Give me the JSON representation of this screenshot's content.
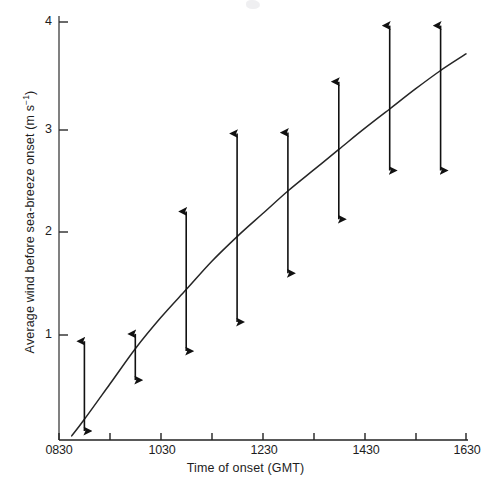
{
  "figure": {
    "background_color": "#ffffff",
    "ink_color": "#1a1a1a"
  },
  "axis": {
    "y_title": "Average wind before sea-breeze onset (m s",
    "y_title_exponent": "−1",
    "y_title_close": ")",
    "x_title": "Time of onset (GMT)",
    "y_tick_labels": [
      "4",
      "3",
      "2",
      "1"
    ],
    "x_tick_labels": [
      "0830",
      "1030",
      "1230",
      "1430",
      "1630"
    ]
  },
  "chart_data": {
    "type": "line",
    "title": "",
    "subtitle": "",
    "xlabel": "Time of onset (GMT)",
    "ylabel": "Average wind before sea-breeze onset (m s^-1)",
    "grid": false,
    "legend": null,
    "xlim_labels": [
      "0830",
      "1630"
    ],
    "xlim_minutes": [
      510,
      990
    ],
    "ylim": [
      0,
      4.15
    ],
    "y_ticks": [
      1,
      2,
      3,
      4
    ],
    "x_ticks_labeled": [
      "0830",
      "1030",
      "1230",
      "1430",
      "1630"
    ],
    "x_ticks_minor_unlabeled": [
      "0930",
      "1130",
      "1330",
      "1530"
    ],
    "fitted_curve": {
      "name": "Fitted trend of average wind before sea-breeze onset",
      "x": [
        "0845",
        "0900",
        "0930",
        "1000",
        "1030",
        "1100",
        "1130",
        "1200",
        "1230",
        "1300",
        "1330",
        "1400",
        "1430",
        "1500",
        "1530",
        "1600",
        "1630"
      ],
      "y": [
        0.02,
        0.18,
        0.52,
        0.86,
        1.16,
        1.43,
        1.7,
        1.94,
        2.16,
        2.38,
        2.58,
        2.78,
        2.98,
        3.17,
        3.36,
        3.54,
        3.7
      ]
    },
    "range_bars": {
      "name": "Range of wind speed (double-headed arrows)",
      "marker": "double-headed-arrow",
      "points": [
        {
          "x": "0900",
          "y_top": 1.0,
          "y_bottom": 0.0
        },
        {
          "x": "1000",
          "y_top": 1.07,
          "y_bottom": 0.49
        },
        {
          "x": "1100",
          "y_top": 2.25,
          "y_bottom": 0.77
        },
        {
          "x": "1200",
          "y_top": 3.0,
          "y_bottom": 1.05
        },
        {
          "x": "1300",
          "y_top": 3.01,
          "y_bottom": 1.52
        },
        {
          "x": "1400",
          "y_top": 3.5,
          "y_bottom": 2.04
        },
        {
          "x": "1500",
          "y_top": 4.04,
          "y_bottom": 2.51
        },
        {
          "x": "1600",
          "y_top": 4.04,
          "y_bottom": 2.51
        }
      ]
    }
  }
}
